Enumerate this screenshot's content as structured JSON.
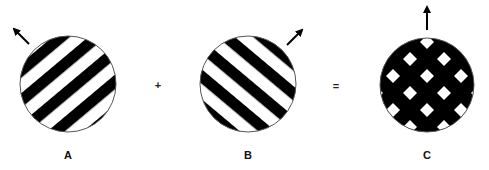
{
  "diagram": {
    "type": "grating-superposition",
    "background": "#ffffff",
    "ink": "#000000",
    "panels": [
      {
        "id": "A",
        "label": "A",
        "pattern": "diagonal-stripes",
        "stripe_orientation": "lower-left to upper-right",
        "motion_arrow": "upper-left"
      },
      {
        "id": "B",
        "label": "B",
        "pattern": "diagonal-stripes",
        "stripe_orientation": "upper-left to lower-right",
        "motion_arrow": "upper-right"
      },
      {
        "id": "C",
        "label": "C",
        "pattern": "plaid (crossed stripes, white diamonds on black)",
        "motion_arrow": "up"
      }
    ],
    "operators": {
      "plus": "+",
      "equals": "="
    }
  }
}
